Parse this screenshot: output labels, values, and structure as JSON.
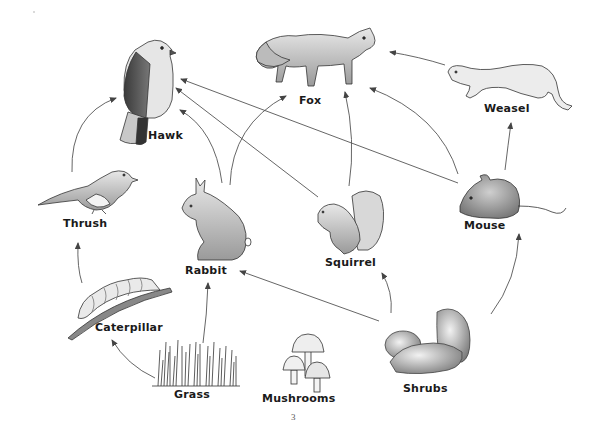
{
  "diagram": {
    "type": "food web",
    "organisms": [
      {
        "id": "hawk",
        "label": "Hawk"
      },
      {
        "id": "fox",
        "label": "Fox"
      },
      {
        "id": "weasel",
        "label": "Weasel"
      },
      {
        "id": "thrush",
        "label": "Thrush"
      },
      {
        "id": "rabbit",
        "label": "Rabbit"
      },
      {
        "id": "squirrel",
        "label": "Squirrel"
      },
      {
        "id": "mouse",
        "label": "Mouse"
      },
      {
        "id": "caterpillar",
        "label": "Caterpillar"
      },
      {
        "id": "grass",
        "label": "Grass"
      },
      {
        "id": "mushrooms",
        "label": "Mushrooms"
      },
      {
        "id": "shrubs",
        "label": "Shrubs"
      }
    ],
    "arrows": [
      {
        "from": "Thrush",
        "to": "Hawk"
      },
      {
        "from": "Rabbit",
        "to": "Hawk"
      },
      {
        "from": "Squirrel",
        "to": "Hawk"
      },
      {
        "from": "Mouse",
        "to": "Hawk"
      },
      {
        "from": "Rabbit",
        "to": "Fox"
      },
      {
        "from": "Squirrel",
        "to": "Fox"
      },
      {
        "from": "Mouse",
        "to": "Fox"
      },
      {
        "from": "Weasel",
        "to": "Fox"
      },
      {
        "from": "Mouse",
        "to": "Weasel"
      },
      {
        "from": "Caterpillar",
        "to": "Thrush"
      },
      {
        "from": "Grass",
        "to": "Caterpillar"
      },
      {
        "from": "Grass",
        "to": "Rabbit"
      },
      {
        "from": "Shrubs",
        "to": "Rabbit"
      },
      {
        "from": "Shrubs",
        "to": "Squirrel"
      },
      {
        "from": "Shrubs",
        "to": "Mouse"
      }
    ]
  },
  "labels": {
    "hawk": "Hawk",
    "fox": "Fox",
    "weasel": "Weasel",
    "thrush": "Thrush",
    "rabbit": "Rabbit",
    "squirrel": "Squirrel",
    "mouse": "Mouse",
    "caterpillar": "Caterpillar",
    "grass": "Grass",
    "mushrooms": "Mushrooms",
    "shrubs": "Shrubs"
  },
  "page_number": "3",
  "colors": {
    "ink": "#1a1a1a",
    "arrow": "#555555",
    "background": "#ffffff"
  }
}
